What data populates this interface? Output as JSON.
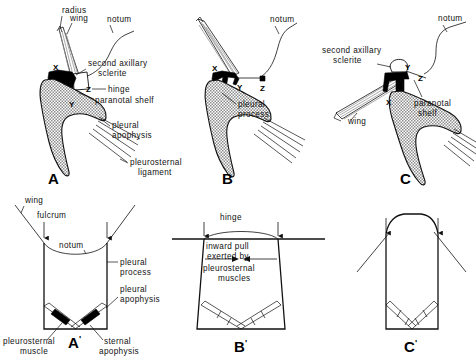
{
  "figure": {
    "background_color": "#ffffff",
    "ink_color": "#111111",
    "fill_stipple_color": "#9a9a9a",
    "sclerite_black": "#000000"
  },
  "panels": [
    {
      "id": "A",
      "letter": "A",
      "prime": "",
      "labels": [
        {
          "key": "radius",
          "text": "radius"
        },
        {
          "key": "wing",
          "text": "wing"
        },
        {
          "key": "notum",
          "text": "notum"
        },
        {
          "key": "second_axillary_1",
          "text": "second  axillary"
        },
        {
          "key": "second_axillary_2",
          "text": "sclerite"
        },
        {
          "key": "hinge",
          "text": "hinge"
        },
        {
          "key": "paranotal_shelf",
          "text": "paranotal   shelf"
        },
        {
          "key": "pleural_apophysis_1",
          "text": "pleural"
        },
        {
          "key": "pleural_apophysis_2",
          "text": "apophysis"
        },
        {
          "key": "pleurosternal_lig_1",
          "text": "pleurosternal"
        },
        {
          "key": "pleurosternal_lig_2",
          "text": "ligament"
        }
      ],
      "points": [
        {
          "key": "X",
          "text": "X"
        },
        {
          "key": "Y",
          "text": "Y"
        },
        {
          "key": "Z",
          "text": "Z"
        }
      ]
    },
    {
      "id": "B",
      "letter": "B",
      "prime": "",
      "labels": [
        {
          "key": "notum",
          "text": "notum"
        },
        {
          "key": "pleural_process_1",
          "text": "pleural"
        },
        {
          "key": "pleural_process_2",
          "text": "process"
        }
      ],
      "points": [
        {
          "key": "X",
          "text": "X"
        },
        {
          "key": "Y",
          "text": "Y"
        },
        {
          "key": "Z",
          "text": "Z"
        }
      ]
    },
    {
      "id": "C",
      "letter": "C",
      "prime": "",
      "labels": [
        {
          "key": "notum",
          "text": "notum"
        },
        {
          "key": "second_axillary_1",
          "text": "second   axillary"
        },
        {
          "key": "second_axillary_2",
          "text": "sclerite"
        },
        {
          "key": "paranotal_shelf_1",
          "text": "paranotal"
        },
        {
          "key": "paranotal_shelf_2",
          "text": "shelf"
        },
        {
          "key": "wing",
          "text": "wing"
        }
      ],
      "points": [
        {
          "key": "X",
          "text": "X"
        },
        {
          "key": "Y",
          "text": "Y"
        },
        {
          "key": "Z",
          "text": "Z"
        }
      ]
    },
    {
      "id": "A-prime",
      "letter": "A",
      "prime": "'",
      "labels": [
        {
          "key": "wing",
          "text": "wing"
        },
        {
          "key": "fulcrum",
          "text": "fulcrum"
        },
        {
          "key": "notum",
          "text": "notum"
        },
        {
          "key": "pleural_process_1",
          "text": "pleural"
        },
        {
          "key": "pleural_process_2",
          "text": "process"
        },
        {
          "key": "pleural_apophysis_1",
          "text": "pleural"
        },
        {
          "key": "pleural_apophysis_2",
          "text": "apophysis"
        },
        {
          "key": "pleurosternal_muscle_1",
          "text": "pleurosternal"
        },
        {
          "key": "pleurosternal_muscle_2",
          "text": "muscle"
        },
        {
          "key": "sternal_apophysis_1",
          "text": "sternal"
        },
        {
          "key": "sternal_apophysis_2",
          "text": "apophysis"
        }
      ],
      "points": []
    },
    {
      "id": "B-prime",
      "letter": "B",
      "prime": "'",
      "labels": [
        {
          "key": "hinge",
          "text": "hinge"
        },
        {
          "key": "pull_1",
          "text": "inward  pull"
        },
        {
          "key": "pull_2",
          "text": "exerted  by"
        },
        {
          "key": "pull_3",
          "text": "pleurosternal"
        },
        {
          "key": "pull_4",
          "text": "muscles"
        }
      ],
      "points": []
    },
    {
      "id": "C-prime",
      "letter": "C",
      "prime": "'",
      "labels": [],
      "points": []
    }
  ]
}
